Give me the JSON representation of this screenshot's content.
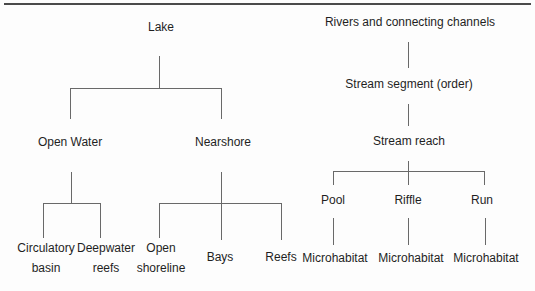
{
  "meta": {
    "background_color": "#fdfdfd",
    "line_color": "#696969",
    "text_color": "#1f1f1f",
    "top_rule_color": "#4a4a4a"
  },
  "lake_tree": {
    "root": {
      "label": "Lake"
    },
    "level2": {
      "open_water": {
        "label": "Open Water"
      },
      "nearshore": {
        "label": "Nearshore"
      }
    },
    "open_water_children": {
      "circulatory_basin": {
        "line1": "Circulatory",
        "line2": "basin"
      },
      "deepwater_reefs": {
        "line1": "Deepwater",
        "line2": "reefs"
      }
    },
    "nearshore_children": {
      "open_shoreline": {
        "line1": "Open",
        "line2": "shoreline"
      },
      "bays": {
        "label": "Bays"
      },
      "reefs": {
        "label": "Reefs"
      }
    }
  },
  "river_tree": {
    "root": {
      "label": "Rivers and connecting channels"
    },
    "stream_segment": {
      "label": "Stream segment (order)"
    },
    "stream_reach": {
      "label": "Stream reach"
    },
    "reach_children": {
      "pool": {
        "label": "Pool"
      },
      "riffle": {
        "label": "Riffle"
      },
      "run": {
        "label": "Run"
      }
    },
    "microhabitats": {
      "under_pool": "Microhabitat",
      "under_riffle": "Microhabitat",
      "under_run": "Microhabitat"
    }
  }
}
